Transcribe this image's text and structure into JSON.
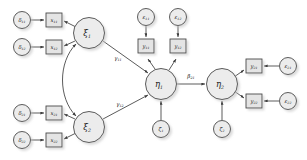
{
  "figure": {
    "type": "sem-path-diagram",
    "background_color": "#ffffff",
    "node_fill_color": "#e8e8e8",
    "node_stroke_color": "#4a4a4a",
    "path_color": "#3d3d3d"
  },
  "latent_variables": [
    {
      "id": "xi1",
      "label": "ξ",
      "subscript": "1",
      "shape": "circle",
      "x": 89,
      "y": 33,
      "r": 15.5
    },
    {
      "id": "xi2",
      "label": "ξ",
      "subscript": "2",
      "shape": "circle",
      "x": 89,
      "y": 127,
      "r": 15.5
    },
    {
      "id": "eta1",
      "label": "η",
      "subscript": "1",
      "shape": "circle",
      "x": 161,
      "y": 84,
      "r": 15.5
    },
    {
      "id": "eta2",
      "label": "η",
      "subscript": "2",
      "shape": "circle",
      "x": 222,
      "y": 84,
      "r": 15.5
    }
  ],
  "indicators": [
    {
      "id": "x11",
      "label": "x",
      "subscript": "11",
      "shape": "box",
      "x": 54,
      "y": 20,
      "w": 16,
      "h": 14
    },
    {
      "id": "x12",
      "label": "x",
      "subscript": "12",
      "shape": "box",
      "x": 54,
      "y": 47,
      "w": 16,
      "h": 14
    },
    {
      "id": "x21",
      "label": "x",
      "subscript": "21",
      "shape": "box",
      "x": 54,
      "y": 113,
      "w": 16,
      "h": 14
    },
    {
      "id": "x22",
      "label": "x",
      "subscript": "22",
      "shape": "box",
      "x": 54,
      "y": 140,
      "w": 16,
      "h": 14
    },
    {
      "id": "y11",
      "label": "y",
      "subscript": "11",
      "shape": "box",
      "x": 146,
      "y": 46,
      "w": 16,
      "h": 14
    },
    {
      "id": "y12",
      "label": "y",
      "subscript": "12",
      "shape": "box",
      "x": 178,
      "y": 46,
      "w": 16,
      "h": 14
    },
    {
      "id": "y21",
      "label": "y",
      "subscript": "21",
      "shape": "box",
      "x": 254,
      "y": 66,
      "w": 16,
      "h": 14
    },
    {
      "id": "y22",
      "label": "y",
      "subscript": "22",
      "shape": "box",
      "x": 254,
      "y": 101,
      "w": 16,
      "h": 14
    }
  ],
  "error_terms": [
    {
      "id": "delta11",
      "label": "δ",
      "subscript": "11",
      "shape": "circle",
      "x": 22,
      "y": 20,
      "r": 8.5
    },
    {
      "id": "delta12",
      "label": "δ",
      "subscript": "12",
      "shape": "circle",
      "x": 22,
      "y": 47,
      "r": 8.5
    },
    {
      "id": "delta21",
      "label": "δ",
      "subscript": "21",
      "shape": "circle",
      "x": 22,
      "y": 113,
      "r": 8.5
    },
    {
      "id": "delta22",
      "label": "δ",
      "subscript": "22",
      "shape": "circle",
      "x": 22,
      "y": 140,
      "r": 8.5
    },
    {
      "id": "eps11",
      "label": "ε",
      "subscript": "11",
      "shape": "circle",
      "x": 146,
      "y": 17,
      "r": 8.5
    },
    {
      "id": "eps12",
      "label": "ε",
      "subscript": "12",
      "shape": "circle",
      "x": 178,
      "y": 17,
      "r": 8.5
    },
    {
      "id": "eps21",
      "label": "ε",
      "subscript": "21",
      "shape": "circle",
      "x": 288,
      "y": 66,
      "r": 8.5
    },
    {
      "id": "eps22",
      "label": "ε",
      "subscript": "22",
      "shape": "circle",
      "x": 288,
      "y": 101,
      "r": 8.5
    },
    {
      "id": "zeta1",
      "label": "ζ",
      "subscript": "1",
      "shape": "circle",
      "x": 161,
      "y": 129,
      "r": 8.5
    },
    {
      "id": "zeta2",
      "label": "ζ",
      "subscript": "2",
      "shape": "circle",
      "x": 222,
      "y": 129,
      "r": 8.5
    }
  ],
  "path_labels": [
    {
      "id": "gamma11",
      "label": "γ",
      "subscript": "11",
      "x": 118,
      "y": 58,
      "from": "xi1",
      "to": "eta1"
    },
    {
      "id": "gamma12",
      "label": "γ",
      "subscript": "12",
      "x": 120,
      "y": 104,
      "from": "xi2",
      "to": "eta1"
    },
    {
      "id": "beta21",
      "label": "β",
      "subscript": "21",
      "x": 191,
      "y": 76,
      "from": "eta1",
      "to": "eta2"
    }
  ],
  "covariance": {
    "id": "phi21",
    "from": "xi1",
    "to": "xi2",
    "arrow_type": "double-headed-curved",
    "label": ""
  },
  "structural_paths": [
    {
      "from": "xi1",
      "to": "eta1",
      "label": "γ11"
    },
    {
      "from": "xi2",
      "to": "eta1",
      "label": "γ12"
    },
    {
      "from": "eta1",
      "to": "eta2",
      "label": "β21"
    }
  ],
  "measurement_paths": [
    {
      "from": "xi1",
      "to": "x11"
    },
    {
      "from": "xi1",
      "to": "x12"
    },
    {
      "from": "xi2",
      "to": "x21"
    },
    {
      "from": "xi2",
      "to": "x22"
    },
    {
      "from": "eta1",
      "to": "y11"
    },
    {
      "from": "eta1",
      "to": "y12"
    },
    {
      "from": "eta2",
      "to": "y21"
    },
    {
      "from": "eta2",
      "to": "y22"
    }
  ],
  "error_paths": [
    {
      "from": "delta11",
      "to": "x11"
    },
    {
      "from": "delta12",
      "to": "x12"
    },
    {
      "from": "delta21",
      "to": "x21"
    },
    {
      "from": "delta22",
      "to": "x22"
    },
    {
      "from": "eps11",
      "to": "y11"
    },
    {
      "from": "eps12",
      "to": "y12"
    },
    {
      "from": "eps21",
      "to": "y21"
    },
    {
      "from": "eps22",
      "to": "y22"
    },
    {
      "from": "zeta1",
      "to": "eta1"
    },
    {
      "from": "zeta2",
      "to": "eta2"
    }
  ]
}
